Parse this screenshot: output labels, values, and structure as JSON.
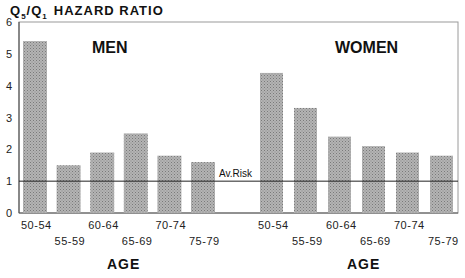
{
  "chart_data": {
    "type": "bar",
    "title_parts": {
      "q": "Q",
      "sub5": "5",
      "slash": "/",
      "q2": "Q",
      "sub1": "1",
      "rest": "HAZARD RATIO"
    },
    "ylabel": "Q5/Q1 HAZARD RATIO",
    "ylim": [
      0,
      6
    ],
    "yticks": [
      "0",
      "1",
      "2",
      "3",
      "4",
      "5",
      "6"
    ],
    "xlabel": "AGE",
    "categories": [
      "50-54",
      "55-59",
      "60-64",
      "65-69",
      "70-74",
      "75-79"
    ],
    "series": [
      {
        "name": "MEN",
        "values": [
          5.4,
          1.5,
          1.9,
          2.5,
          1.8,
          1.6
        ]
      },
      {
        "name": "WOMEN",
        "values": [
          4.4,
          3.3,
          2.4,
          2.1,
          1.9,
          1.8
        ]
      }
    ],
    "reference_line": {
      "label": "Av.Risk",
      "value": 1.0
    },
    "bar_color": "#a9a9a9",
    "grid": false,
    "legend": "none"
  }
}
